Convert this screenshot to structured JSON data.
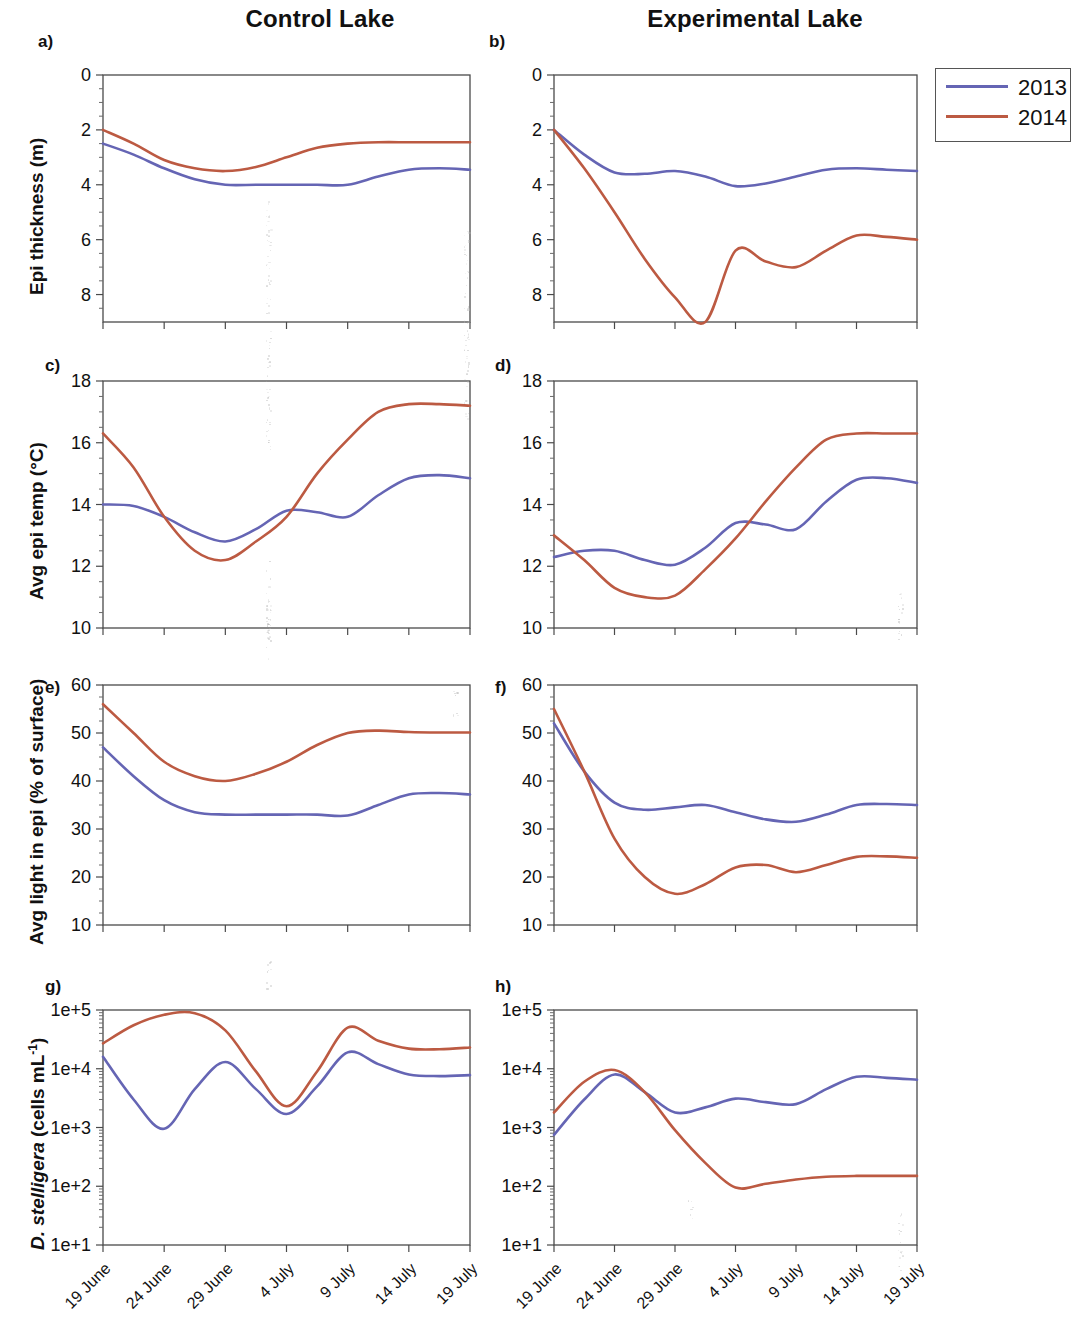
{
  "figure": {
    "column_titles": {
      "left": "Control Lake",
      "right": "Experimental Lake"
    },
    "panel_letters": [
      "a)",
      "b)",
      "c)",
      "d)",
      "e)",
      "f)",
      "g)",
      "h)"
    ],
    "y_axis_labels": {
      "row1": "Epi thickness (m)",
      "row2": "Avg epi temp (°C)",
      "row3": "Avg light in epi (% of surface)",
      "row4_italic": "D. stelligera",
      "row4_rest": " (cells mL",
      "row4_sup": "-1",
      "row4_tail": ")"
    },
    "x_tick_labels": [
      "19 June",
      "24 June",
      "29 June",
      "4 July",
      "9 July",
      "14 July",
      "19 July"
    ],
    "legend": {
      "entries": [
        {
          "label": "2013",
          "color": "#6565b4"
        },
        {
          "label": "2014",
          "color": "#bc5a42"
        }
      ]
    },
    "colors": {
      "series_2013": "#6565b4",
      "series_2014": "#bc5a42",
      "axis": "#4a4a4a",
      "text": "#111111"
    }
  },
  "chart_data": [
    {
      "id": "a",
      "type": "line",
      "title": "a) Control Lake — Epi thickness",
      "xlabel": "",
      "ylabel": "Epi thickness (m)",
      "x": [
        "19 June",
        "21 June",
        "24 June",
        "27 June",
        "29 June",
        "2 July",
        "4 July",
        "7 July",
        "9 July",
        "12 July",
        "14 July",
        "17 July",
        "19 July"
      ],
      "ylim": [
        0,
        9
      ],
      "y_ticks": [
        0,
        2,
        4,
        6,
        8
      ],
      "y_inverted": true,
      "grid": false,
      "series": [
        {
          "name": "2013",
          "color": "#6565b4",
          "values": [
            2.5,
            2.9,
            3.4,
            3.8,
            4.0,
            4.0,
            4.0,
            4.0,
            4.0,
            3.7,
            3.45,
            3.4,
            3.45
          ]
        },
        {
          "name": "2014",
          "color": "#bc5a42",
          "values": [
            2.0,
            2.5,
            3.1,
            3.4,
            3.5,
            3.35,
            3.0,
            2.65,
            2.5,
            2.45,
            2.45,
            2.45,
            2.45
          ]
        }
      ]
    },
    {
      "id": "b",
      "type": "line",
      "title": "b) Experimental Lake — Epi thickness",
      "xlabel": "",
      "ylabel": "Epi thickness (m)",
      "x": [
        "19 June",
        "21 June",
        "24 June",
        "27 June",
        "29 June",
        "2 July",
        "4 July",
        "7 July",
        "9 July",
        "12 July",
        "14 July",
        "17 July",
        "19 July"
      ],
      "ylim": [
        0,
        9
      ],
      "y_ticks": [
        0,
        2,
        4,
        6,
        8
      ],
      "y_inverted": true,
      "grid": false,
      "series": [
        {
          "name": "2013",
          "color": "#6565b4",
          "values": [
            2.0,
            2.9,
            3.55,
            3.6,
            3.5,
            3.7,
            4.05,
            3.95,
            3.7,
            3.45,
            3.4,
            3.45,
            3.5
          ]
        },
        {
          "name": "2014",
          "color": "#bc5a42",
          "values": [
            2.0,
            3.4,
            5.0,
            6.7,
            8.1,
            9.0,
            6.4,
            6.8,
            7.0,
            6.4,
            5.85,
            5.9,
            6.0
          ]
        }
      ]
    },
    {
      "id": "c",
      "type": "line",
      "title": "c) Control Lake — Avg epi temp",
      "xlabel": "",
      "ylabel": "Avg epi temp (°C)",
      "x": [
        "19 June",
        "21 June",
        "24 June",
        "27 June",
        "29 June",
        "2 July",
        "4 July",
        "7 July",
        "9 July",
        "12 July",
        "14 July",
        "17 July",
        "19 July"
      ],
      "ylim": [
        10,
        18
      ],
      "y_ticks": [
        10,
        12,
        14,
        16,
        18
      ],
      "y_inverted": false,
      "grid": false,
      "series": [
        {
          "name": "2013",
          "color": "#6565b4",
          "values": [
            14.0,
            13.95,
            13.6,
            13.1,
            12.8,
            13.2,
            13.8,
            13.75,
            13.6,
            14.3,
            14.85,
            14.95,
            14.85
          ]
        },
        {
          "name": "2014",
          "color": "#bc5a42",
          "values": [
            16.3,
            15.2,
            13.6,
            12.5,
            12.2,
            12.8,
            13.6,
            15.0,
            16.1,
            17.0,
            17.25,
            17.25,
            17.2
          ]
        }
      ]
    },
    {
      "id": "d",
      "type": "line",
      "title": "d) Experimental Lake — Avg epi temp",
      "xlabel": "",
      "ylabel": "Avg epi temp (°C)",
      "x": [
        "19 June",
        "21 June",
        "24 June",
        "27 June",
        "29 June",
        "2 July",
        "4 July",
        "7 July",
        "9 July",
        "12 July",
        "14 July",
        "17 July",
        "19 July"
      ],
      "ylim": [
        10,
        18
      ],
      "y_ticks": [
        10,
        12,
        14,
        16,
        18
      ],
      "y_inverted": false,
      "grid": false,
      "series": [
        {
          "name": "2013",
          "color": "#6565b4",
          "values": [
            12.3,
            12.5,
            12.5,
            12.2,
            12.05,
            12.6,
            13.4,
            13.35,
            13.2,
            14.1,
            14.8,
            14.85,
            14.7
          ]
        },
        {
          "name": "2014",
          "color": "#bc5a42",
          "values": [
            13.0,
            12.2,
            11.3,
            11.0,
            11.05,
            11.9,
            12.9,
            14.1,
            15.2,
            16.1,
            16.3,
            16.3,
            16.3
          ]
        }
      ]
    },
    {
      "id": "e",
      "type": "line",
      "title": "e) Control Lake — Avg light in epi",
      "xlabel": "",
      "ylabel": "Avg light in epi (% of surface)",
      "x": [
        "19 June",
        "21 June",
        "24 June",
        "27 June",
        "29 June",
        "2 July",
        "4 July",
        "7 July",
        "9 July",
        "12 July",
        "14 July",
        "17 July",
        "19 July"
      ],
      "ylim": [
        10,
        60
      ],
      "y_ticks": [
        10,
        20,
        30,
        40,
        50,
        60
      ],
      "y_inverted": false,
      "grid": false,
      "series": [
        {
          "name": "2013",
          "color": "#6565b4",
          "values": [
            47,
            41,
            36,
            33.5,
            33,
            33,
            33,
            33,
            32.8,
            35,
            37.2,
            37.5,
            37.2
          ]
        },
        {
          "name": "2014",
          "color": "#bc5a42",
          "values": [
            56,
            50,
            44,
            41,
            40,
            41.5,
            44,
            47.5,
            50,
            50.5,
            50.2,
            50.1,
            50.1
          ]
        }
      ]
    },
    {
      "id": "f",
      "type": "line",
      "title": "f) Experimental Lake — Avg light in epi",
      "xlabel": "",
      "ylabel": "Avg light in epi (% of surface)",
      "x": [
        "19 June",
        "21 June",
        "24 June",
        "27 June",
        "29 June",
        "2 July",
        "4 July",
        "7 July",
        "9 July",
        "12 July",
        "14 July",
        "17 July",
        "19 July"
      ],
      "ylim": [
        10,
        60
      ],
      "y_ticks": [
        10,
        20,
        30,
        40,
        50,
        60
      ],
      "y_inverted": false,
      "grid": false,
      "series": [
        {
          "name": "2013",
          "color": "#6565b4",
          "values": [
            52,
            42,
            35.5,
            34,
            34.5,
            35,
            33.5,
            32,
            31.5,
            33,
            35,
            35.2,
            35
          ]
        },
        {
          "name": "2014",
          "color": "#bc5a42",
          "values": [
            55,
            42,
            28,
            20,
            16.5,
            18.5,
            22,
            22.5,
            21,
            22.5,
            24.2,
            24.3,
            24
          ]
        }
      ]
    },
    {
      "id": "g",
      "type": "line",
      "title": "g) Control Lake — D. stelligera",
      "xlabel": "",
      "ylabel": "D. stelligera (cells mL-1)",
      "x": [
        "19 June",
        "21 June",
        "24 June",
        "27 June",
        "29 June",
        "2 July",
        "4 July",
        "7 July",
        "9 July",
        "12 July",
        "14 July",
        "17 July",
        "19 July"
      ],
      "ylim": [
        10,
        100000
      ],
      "y_scale": "log",
      "y_ticks": [
        10,
        100,
        1000,
        10000,
        100000
      ],
      "y_tick_labels": [
        "1e+1",
        "1e+2",
        "1e+3",
        "1e+4",
        "1e+5"
      ],
      "grid": false,
      "series": [
        {
          "name": "2013",
          "color": "#6565b4",
          "values": [
            16000,
            3000,
            950,
            4500,
            13000,
            4500,
            1700,
            5000,
            19000,
            12000,
            8000,
            7500,
            7800
          ]
        },
        {
          "name": "2014",
          "color": "#bc5a42",
          "values": [
            27000,
            55000,
            83000,
            88000,
            45000,
            9000,
            2300,
            9000,
            50000,
            30000,
            22000,
            21500,
            23000
          ]
        }
      ]
    },
    {
      "id": "h",
      "type": "line",
      "title": "h) Experimental Lake — D. stelligera",
      "xlabel": "",
      "ylabel": "D. stelligera (cells mL-1)",
      "x": [
        "19 June",
        "21 June",
        "24 June",
        "27 June",
        "29 June",
        "2 July",
        "4 July",
        "7 July",
        "9 July",
        "12 July",
        "14 July",
        "17 July",
        "19 July"
      ],
      "ylim": [
        10,
        100000
      ],
      "y_scale": "log",
      "y_ticks": [
        10,
        100,
        1000,
        10000,
        100000
      ],
      "y_tick_labels": [
        "1e+1",
        "1e+2",
        "1e+3",
        "1e+4",
        "1e+5"
      ],
      "grid": false,
      "series": [
        {
          "name": "2013",
          "color": "#6565b4",
          "values": [
            750,
            3000,
            8000,
            4000,
            1800,
            2200,
            3100,
            2700,
            2500,
            4500,
            7300,
            7000,
            6500
          ]
        },
        {
          "name": "2014",
          "color": "#bc5a42",
          "values": [
            1800,
            6000,
            9500,
            4000,
            900,
            250,
            95,
            110,
            130,
            145,
            150,
            150,
            150
          ]
        }
      ]
    }
  ]
}
